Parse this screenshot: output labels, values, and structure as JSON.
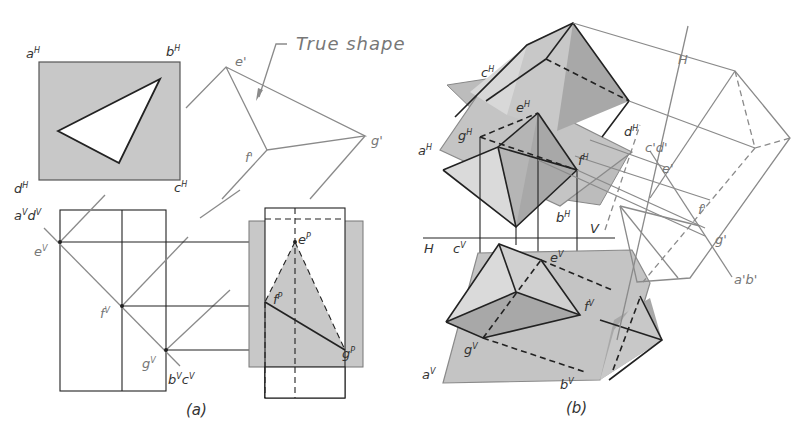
{
  "figure": {
    "panels": [
      {
        "id": "a",
        "caption": "(a)"
      },
      {
        "id": "b",
        "caption": "(b)"
      }
    ],
    "annotation": "True shape",
    "colors": {
      "plane_fill": "#c8c8c8",
      "dark_face": "#a8a8a8",
      "mid_face": "#bdbdbd",
      "light_face": "#dcdcdc",
      "ink": "#222222",
      "construction": "#8a8a8a"
    },
    "panel_a": {
      "top_view_labels": {
        "a": "a",
        "a_sup": "H",
        "b": "b",
        "b_sup": "H",
        "c": "c",
        "c_sup": "H",
        "d": "d",
        "d_sup": "H"
      },
      "true_shape_labels": {
        "e": "e",
        "e_sup": "'",
        "f": "f",
        "f_sup": "'",
        "g": "g",
        "g_sup": "'"
      },
      "front_view_labels": {
        "ad": "a",
        "ad_sup": "V",
        "ad2": "d",
        "ad2_sup": "V",
        "e": "e",
        "e_sup": "V",
        "f": "f",
        "f_sup": "V",
        "g": "g",
        "g_sup": "V",
        "bc": "b",
        "bc_sup": "V",
        "bc2": "c",
        "bc2_sup": "V"
      },
      "profile_labels": {
        "e": "e",
        "e_sup": "P",
        "f": "f",
        "f_sup": "P",
        "g": "g",
        "g_sup": "P"
      }
    },
    "panel_b": {
      "labels": {
        "cH": "c",
        "cH_sup": "H",
        "eH": "e",
        "eH_sup": "H",
        "gH": "g",
        "gH_sup": "H",
        "aH": "a",
        "aH_sup": "H",
        "dH": "d",
        "dH_sup": "H",
        "fH": "f",
        "fH_sup": "H",
        "bH": "b",
        "bH_sup": "H",
        "H_line": "H",
        "V_line": "V",
        "H_axis": "H",
        "cV": "c",
        "cV_sup": "V",
        "eV": "e",
        "eV_sup": "V",
        "fV": "f",
        "fV_sup": "V",
        "gV": "g",
        "gV_sup": "V",
        "aV": "a",
        "aV_sup": "V",
        "bV": "b",
        "bV_sup": "V",
        "cd1": "c'd'",
        "e1": "e'",
        "f1": "f'",
        "g1": "g'",
        "ab1": "a'b'"
      }
    }
  }
}
